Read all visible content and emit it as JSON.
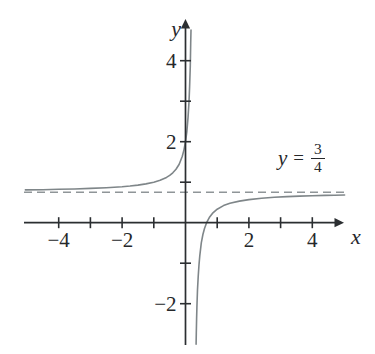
{
  "chart_data": {
    "type": "line",
    "title": "",
    "xlabel": "x",
    "ylabel": "y",
    "xlim": [
      -5.1,
      5.15
    ],
    "ylim": [
      -3.05,
      5.1
    ],
    "grid": false,
    "legend": false,
    "x_axis": {
      "label": "x",
      "ticks": [
        {
          "v": -4,
          "label": "−4"
        },
        {
          "v": -3,
          "label": ""
        },
        {
          "v": -2,
          "label": "−2"
        },
        {
          "v": -1,
          "label": ""
        },
        {
          "v": 1,
          "label": ""
        },
        {
          "v": 2,
          "label": "2"
        },
        {
          "v": 3,
          "label": ""
        },
        {
          "v": 4,
          "label": "4"
        }
      ]
    },
    "y_axis": {
      "label": "y",
      "ticks": [
        {
          "v": 4,
          "label": "4"
        },
        {
          "v": 3,
          "label": ""
        },
        {
          "v": 2,
          "label": "2"
        },
        {
          "v": 1,
          "label": ""
        },
        {
          "v": -1,
          "label": ""
        },
        {
          "v": -2,
          "label": "−2"
        }
      ]
    },
    "horizontal_asymptote": {
      "y": 0.75,
      "style": "dashed",
      "label_text": "y = 3/4"
    },
    "vertical_asymptote_estimate": 0.25,
    "x_intercept_estimate": 0.667,
    "y_intercept_estimate": 2.0,
    "annotation": {
      "variable": "y",
      "equals": "=",
      "numerator": "3",
      "denominator": "4"
    },
    "series": [
      {
        "name": "upper-left-branch",
        "points": [
          [
            -5.05,
            0.81
          ],
          [
            -4.5,
            0.816
          ],
          [
            -4,
            0.824
          ],
          [
            -3.5,
            0.833
          ],
          [
            -3,
            0.846
          ],
          [
            -2.5,
            0.864
          ],
          [
            -2,
            0.889
          ],
          [
            -1.75,
            0.906
          ],
          [
            -1.5,
            0.929
          ],
          [
            -1.25,
            0.958
          ],
          [
            -1,
            1.0
          ],
          [
            -0.8,
            1.048
          ],
          [
            -0.6,
            1.118
          ],
          [
            -0.5,
            1.167
          ],
          [
            -0.4,
            1.231
          ],
          [
            -0.3,
            1.318
          ],
          [
            -0.2,
            1.444
          ],
          [
            -0.1,
            1.643
          ],
          [
            -0.05,
            1.792
          ],
          [
            0,
            2.0
          ],
          [
            0.04,
            2.238
          ],
          [
            0.08,
            2.588
          ],
          [
            0.11,
            2.982
          ],
          [
            0.13,
            3.354
          ],
          [
            0.15,
            3.875
          ],
          [
            0.165,
            4.427
          ],
          [
            0.172,
            4.756
          ]
        ]
      },
      {
        "name": "lower-right-branch",
        "points": [
          [
            0.333,
            -3.0
          ],
          [
            0.34,
            -2.722
          ],
          [
            0.35,
            -2.375
          ],
          [
            0.36,
            -2.091
          ],
          [
            0.38,
            -1.654
          ],
          [
            0.4,
            -1.333
          ],
          [
            0.425,
            -1.036
          ],
          [
            0.45,
            -0.813
          ],
          [
            0.5,
            -0.5
          ],
          [
            0.55,
            -0.292
          ],
          [
            0.6,
            -0.143
          ],
          [
            0.667,
            0.0
          ],
          [
            0.75,
            0.125
          ],
          [
            0.85,
            0.229
          ],
          [
            1,
            0.333
          ],
          [
            1.2,
            0.421
          ],
          [
            1.4,
            0.478
          ],
          [
            1.7,
            0.534
          ],
          [
            2,
            0.571
          ],
          [
            2.4,
            0.605
          ],
          [
            2.8,
            0.627
          ],
          [
            3.2,
            0.644
          ],
          [
            3.6,
            0.657
          ],
          [
            4,
            0.667
          ],
          [
            4.4,
            0.675
          ],
          [
            4.7,
            0.68
          ],
          [
            5.02,
            0.685
          ]
        ]
      }
    ]
  },
  "colors": {
    "background": "#ffffff",
    "axis": "#2b2e31",
    "text": "#26282b",
    "curve": "#7f8689",
    "asymptote": "#8f9598"
  }
}
